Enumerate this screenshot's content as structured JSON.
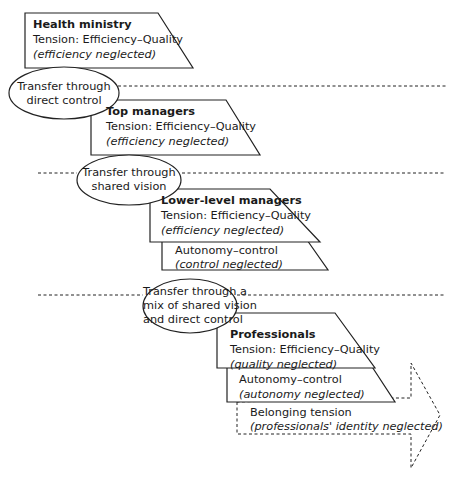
{
  "diagram": {
    "levels": [
      {
        "id": "health-ministry",
        "title": "Health ministry",
        "tension": "Tension: Efficiency–Quality",
        "neglected": "(efficiency neglected)"
      },
      {
        "id": "top-managers",
        "title": "Top managers",
        "tension": "Tension: Efficiency–Quality",
        "neglected": "(efficiency neglected)"
      },
      {
        "id": "lower-level-managers",
        "title": "Lower-level managers",
        "tension": "Tension: Efficiency–Quality",
        "neglected": "(efficiency neglected)",
        "secondary": {
          "tension": "Autonomy–control",
          "neglected": "(control neglected)"
        }
      },
      {
        "id": "professionals",
        "title": "Professionals",
        "tension": "Tension: Efficiency–Quality",
        "neglected": "(quality neglected)",
        "secondary": {
          "tension": "Autonomy–control",
          "neglected": "(autonomy neglected)"
        },
        "tertiary": {
          "tension": "Belonging tension",
          "neglected": "(professionals' identity neglected)"
        }
      }
    ],
    "transfers": [
      {
        "line1": "Transfer through",
        "line2": "direct control"
      },
      {
        "line1": "Transfer through",
        "line2": "shared vision"
      },
      {
        "line1": "Transfer through a",
        "line2": "mix of shared vision",
        "line3": "and direct control"
      }
    ],
    "colors": {
      "stroke": "#222222",
      "background": "#ffffff"
    }
  }
}
